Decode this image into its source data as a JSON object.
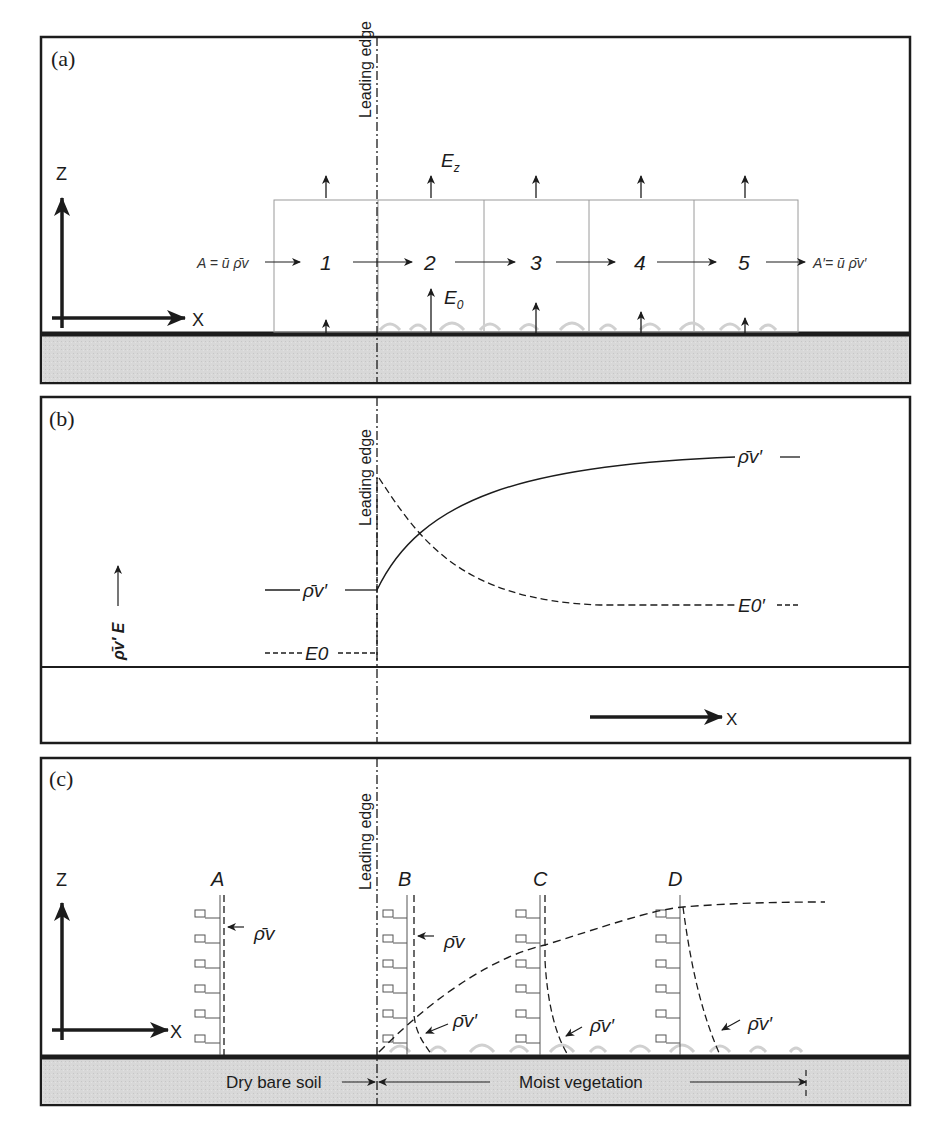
{
  "figure": {
    "panels": [
      {
        "id": "a",
        "label": "(a)",
        "leading_edge_label": "Leading edge",
        "axes": {
          "z_label": "Z",
          "x_label": "X"
        },
        "inflow_label": "A = ū ρ̄v",
        "outflow_label": "A′= ū ρ̄v′",
        "cells": [
          "1",
          "2",
          "3",
          "4",
          "5"
        ],
        "top_flux_label": "Ez",
        "surface_flux_label": "E0"
      },
      {
        "id": "b",
        "label": "(b)",
        "leading_edge_label": "Leading edge",
        "y_axis_label": "ρ̄v′ E",
        "x_label": "X",
        "upstream_labels": {
          "rho": "ρ̄v′",
          "E": "E0"
        },
        "downstream_labels": {
          "rho": "ρ̄v′",
          "E": "E0′"
        }
      },
      {
        "id": "c",
        "label": "(c)",
        "leading_edge_label": "Leading edge",
        "axes": {
          "z_label": "Z",
          "x_label": "X"
        },
        "profiles": [
          {
            "name": "A",
            "annotation": "ρ̄v"
          },
          {
            "name": "B",
            "annotations": [
              "ρ̄v",
              "ρ̄v′"
            ]
          },
          {
            "name": "C",
            "annotation": "ρ̄v′"
          },
          {
            "name": "D",
            "annotation": "ρ̄v′"
          }
        ],
        "surface_labels": {
          "dry": "Dry bare soil",
          "moist": "Moist vegetation"
        }
      }
    ]
  },
  "colors": {
    "ink": "#1c1c1c",
    "soil": "#d6d6d6",
    "grid": "#9a9a9a",
    "vegetation": "#c8c8c8"
  }
}
